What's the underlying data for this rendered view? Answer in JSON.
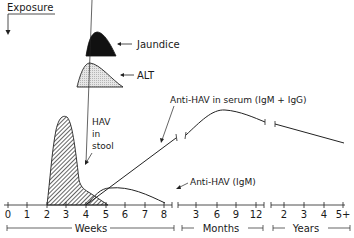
{
  "diagram": {
    "exposure_label": "Exposure",
    "legend": {
      "jaundice": "Jaundice",
      "alt": "ALT"
    },
    "curves": {
      "hav_stool_line1": "HAV",
      "hav_stool_line2": "in",
      "hav_stool_line3": "stool",
      "anti_hav_total": "Anti-HAV in serum (IgM + IgG)",
      "anti_hav_igm": "Anti-HAV (IgM)"
    },
    "axis": {
      "weeks_ticks": [
        "0",
        "1",
        "2",
        "3",
        "4",
        "5",
        "6",
        "7",
        "8"
      ],
      "months_ticks": [
        "3",
        "6",
        "9",
        "12"
      ],
      "years_ticks": [
        "2",
        "3",
        "4",
        "5+"
      ],
      "weeks_label": "Weeks",
      "months_label": "Months",
      "years_label": "Years"
    }
  }
}
